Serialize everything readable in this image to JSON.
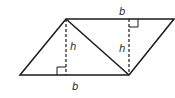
{
  "diagram": {
    "labels": {
      "top_base": "b",
      "bottom_base": "b",
      "left_height": "h",
      "right_height": "h"
    },
    "colors": {
      "stroke": "#1a1a1a",
      "background": "#ffffff"
    }
  }
}
